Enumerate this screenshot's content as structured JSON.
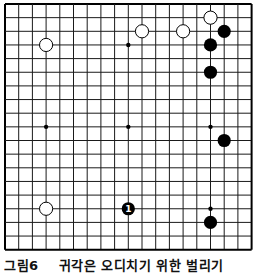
{
  "board": {
    "size": 19,
    "origin_x": 5,
    "origin_y": 4,
    "spacing_x": 13.7,
    "spacing_y": 13.65,
    "line_color": "#1a1a1a",
    "edge_color": "#000000",
    "hoshi": [
      [
        3,
        3
      ],
      [
        9,
        3
      ],
      [
        15,
        3
      ],
      [
        3,
        9
      ],
      [
        9,
        9
      ],
      [
        15,
        9
      ],
      [
        3,
        15
      ],
      [
        9,
        15
      ],
      [
        15,
        15
      ]
    ],
    "stones": [
      {
        "color": "white",
        "col": 3,
        "row": 3
      },
      {
        "color": "white",
        "col": 10,
        "row": 2
      },
      {
        "color": "white",
        "col": 13,
        "row": 2
      },
      {
        "color": "white",
        "col": 15,
        "row": 1
      },
      {
        "color": "black",
        "col": 16,
        "row": 2
      },
      {
        "color": "black",
        "col": 15,
        "row": 3
      },
      {
        "color": "black",
        "col": 15,
        "row": 5
      },
      {
        "color": "black",
        "col": 16,
        "row": 10
      },
      {
        "color": "white",
        "col": 3,
        "row": 15
      },
      {
        "color": "black",
        "col": 9,
        "row": 15,
        "label": "1"
      },
      {
        "color": "black",
        "col": 15,
        "row": 16
      }
    ]
  },
  "caption": {
    "figure": "그림6",
    "text": "귀각은 오디치기 위한 벌리기"
  }
}
